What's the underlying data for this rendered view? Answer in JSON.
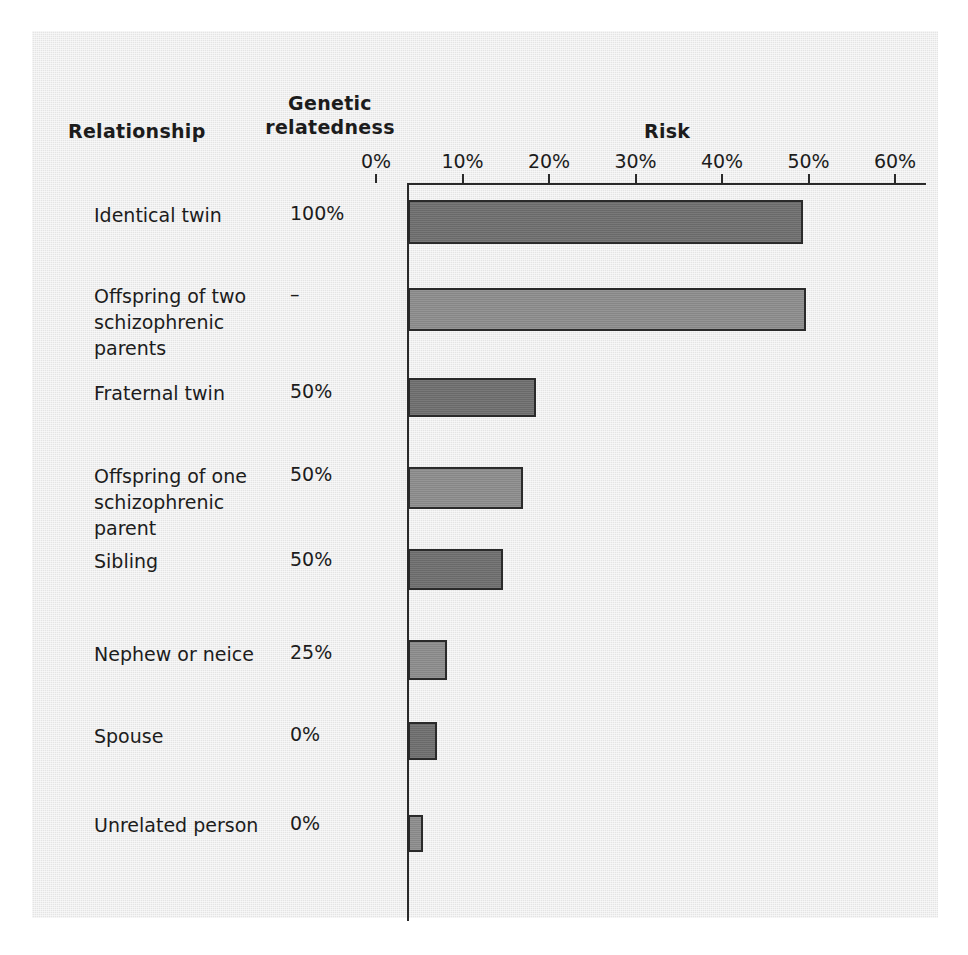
{
  "headers": {
    "relationship": "Relationship",
    "genetic_relatedness": "Genetic relatedness",
    "genetic_line1": "Genetic",
    "genetic_line2": "relatedness",
    "risk": "Risk"
  },
  "axis": {
    "ticks": [
      "0%",
      "10%",
      "20%",
      "30%",
      "40%",
      "50%",
      "60%"
    ]
  },
  "chart_data": {
    "type": "bar",
    "orientation": "horizontal",
    "title": "Risk",
    "xlabel": "Risk",
    "ylabel": "Relationship",
    "xlim": [
      0,
      60
    ],
    "xtick_labels": [
      "0%",
      "10%",
      "20%",
      "30%",
      "40%",
      "50%",
      "60%"
    ],
    "xticks": [
      0,
      10,
      20,
      30,
      40,
      50,
      60
    ],
    "grid": false,
    "legend": "none",
    "categories": [
      "Identical twin",
      "Offspring of two schizophrenic parents",
      "Fraternal twin",
      "Offspring of one schizophrenic parent",
      "Sibling",
      "Nephew or neice",
      "Spouse",
      "Unrelated person"
    ],
    "values": [
      45.7,
      46.0,
      14.8,
      13.3,
      11.0,
      4.5,
      3.4,
      1.7
    ],
    "genetic_relatedness": [
      "100%",
      "–",
      "50%",
      "50%",
      "50%",
      "25%",
      "0%",
      "0%"
    ],
    "bar_colors": [
      "#6f6f6f",
      "#8d8d8d",
      "#6f6f6f",
      "#8d8d8d",
      "#6f6f6f",
      "#8d8d8d",
      "#6f6f6f",
      "#8d8d8d"
    ]
  },
  "rows": [
    {
      "label_line1": "Identical twin",
      "label_line2": "",
      "genetic": "100%",
      "value": 45.7,
      "color": "#6f6f6f",
      "top": 200,
      "height": 44,
      "label_top": 202
    },
    {
      "label_line1": "Offspring  of two",
      "label_line2": "schizophrenic parents",
      "genetic": "–",
      "value": 46.0,
      "color": "#8d8d8d",
      "top": 288,
      "height": 43,
      "label_top": 283
    },
    {
      "label_line1": "Fraternal twin",
      "label_line2": "",
      "genetic": "50%",
      "value": 14.8,
      "color": "#6f6f6f",
      "top": 378,
      "height": 39,
      "label_top": 380
    },
    {
      "label_line1": "Offspring  of one",
      "label_line2": "schizophrenic parent",
      "genetic": "50%",
      "value": 13.3,
      "color": "#8d8d8d",
      "top": 467,
      "height": 42,
      "label_top": 463
    },
    {
      "label_line1": "Sibling",
      "label_line2": "",
      "genetic": "50%",
      "value": 11.0,
      "color": "#6f6f6f",
      "top": 549,
      "height": 41,
      "label_top": 548
    },
    {
      "label_line1": "Nephew or neice",
      "label_line2": "",
      "genetic": "25%",
      "value": 4.5,
      "color": "#8d8d8d",
      "top": 640,
      "height": 40,
      "label_top": 641
    },
    {
      "label_line1": "Spouse",
      "label_line2": "",
      "genetic": "0%",
      "value": 3.4,
      "color": "#6f6f6f",
      "top": 722,
      "height": 38,
      "label_top": 723
    },
    {
      "label_line1": "Unrelated person",
      "label_line2": "",
      "genetic": "0%",
      "value": 1.7,
      "color": "#8d8d8d",
      "top": 815,
      "height": 37,
      "label_top": 812
    }
  ]
}
